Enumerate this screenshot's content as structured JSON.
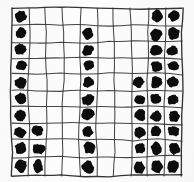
{
  "figure": {
    "medium": "ink on paper, photocopied",
    "background_color": "#fdfdfd",
    "ink_color": "#0d0d0d",
    "grid_line_color": "#2b2b2b"
  },
  "chart_data": {
    "type": "heatmap",
    "title": "",
    "xlabel": "",
    "ylabel": "",
    "rows": 10,
    "columns": 10,
    "categories": [
      "1",
      "2",
      "3",
      "4",
      "5",
      "6",
      "7",
      "8",
      "9",
      "10"
    ],
    "row_labels": [
      "1",
      "2",
      "3",
      "4",
      "5",
      "6",
      "7",
      "8",
      "9",
      "10"
    ],
    "grid": [
      [
        1,
        0,
        0,
        0,
        0,
        0,
        0,
        0,
        1,
        1
      ],
      [
        1,
        0,
        0,
        0,
        1,
        0,
        0,
        0,
        1,
        1
      ],
      [
        1,
        0,
        0,
        0,
        1,
        0,
        0,
        0,
        1,
        1
      ],
      [
        1,
        0,
        0,
        0,
        1,
        0,
        0,
        0,
        1,
        1
      ],
      [
        1,
        0,
        0,
        0,
        1,
        0,
        0,
        1,
        1,
        1
      ],
      [
        1,
        0,
        0,
        0,
        1,
        0,
        0,
        1,
        1,
        1
      ],
      [
        1,
        0,
        0,
        0,
        1,
        0,
        0,
        1,
        1,
        1
      ],
      [
        1,
        1,
        0,
        0,
        1,
        0,
        0,
        1,
        1,
        1
      ],
      [
        1,
        1,
        0,
        0,
        1,
        0,
        0,
        1,
        1,
        1
      ],
      [
        1,
        1,
        0,
        0,
        1,
        0,
        0,
        1,
        1,
        1
      ]
    ],
    "column_totals": [
      10,
      3,
      0,
      0,
      9,
      0,
      0,
      6,
      10,
      10
    ],
    "row_totals": [
      3,
      4,
      4,
      4,
      5,
      5,
      5,
      6,
      6,
      6
    ],
    "filled_count": 48,
    "empty_count": 52,
    "legend": [
      {
        "label": "filled",
        "value": 1,
        "color": "#0d0d0d"
      },
      {
        "label": "empty",
        "value": 0,
        "color": "#fdfdfd"
      }
    ]
  },
  "geometry": {
    "x_lines": [
      12,
      29,
      46,
      63,
      80,
      97,
      114,
      131,
      148,
      165,
      182
    ],
    "y_lines": [
      8,
      25,
      42,
      58,
      74,
      91,
      107,
      124,
      140,
      157,
      176
    ]
  }
}
